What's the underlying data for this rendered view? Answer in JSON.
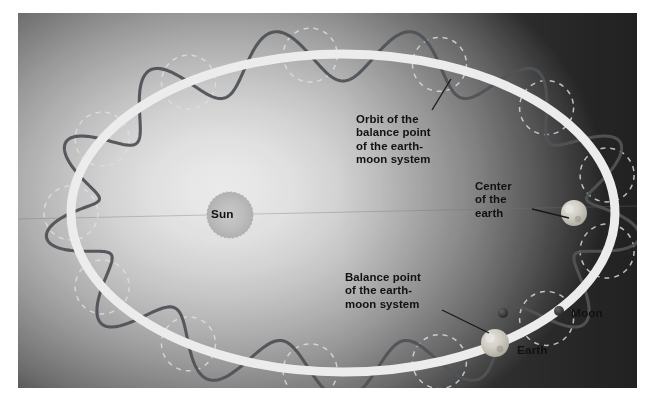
{
  "diagram": {
    "kind": "astronomy-illustration",
    "canvas": {
      "width": 655,
      "height": 401
    },
    "photo_frame": {
      "x": 18,
      "y": 13,
      "width": 619,
      "height": 375
    }
  },
  "labels": {
    "sun": "Sun",
    "earth": "Earth",
    "moon": "Moon",
    "orbit_caption": "Orbit of the\nbalance point\nof the earth-\nmoon system",
    "center_of_earth": "Center\nof the\nearth",
    "balance_point": "Balance point\nof the earth-\nmoon system"
  },
  "bodies": {
    "sun": {
      "cx": 212,
      "cy": 202,
      "r": 23,
      "fill": "#c9c9c9"
    },
    "earth_right": {
      "cx": 556,
      "cy": 200,
      "r": 13
    },
    "earth_bottom": {
      "cx": 477,
      "cy": 330,
      "r": 14
    },
    "moon_near": {
      "cx": 485,
      "cy": 300,
      "r": 5
    },
    "moon_far": {
      "cx": 541,
      "cy": 298,
      "r": 5
    }
  },
  "orbit": {
    "cx": 325,
    "cy": 200,
    "rx": 272,
    "ry": 159,
    "stroke": "#ffffff",
    "stroke_width": 9,
    "wave_stroke": "#555a5e",
    "wave_stroke_width": 3.1,
    "wave_lobes": 13,
    "wave_amplitude": 27,
    "dashed_stroke": "#f2f2f2",
    "dashed_circle_r": 27,
    "dashed_count": 13
  },
  "colors": {
    "background_light": "#fdfdfd",
    "background_mid": "#b4b4b4",
    "background_dark": "#3c3c3c",
    "label_text": "#111111",
    "leader_line": "#1a1a1a"
  },
  "leaders": {
    "orbit": {
      "x1": 433,
      "y1": 66,
      "x2": 414,
      "y2": 97
    },
    "center_of_earth": {
      "x1": 514,
      "y1": 196,
      "x2": 551,
      "y2": 205
    },
    "balance_point": {
      "x1": 424,
      "y1": 297,
      "x2": 471,
      "y2": 320
    }
  }
}
